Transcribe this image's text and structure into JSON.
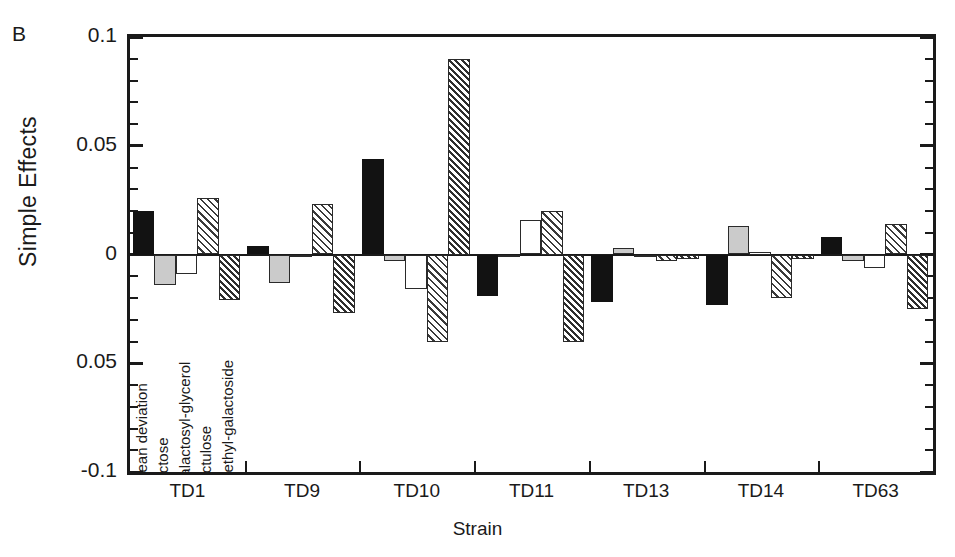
{
  "panel_letter": "B",
  "axis": {
    "ylabel": "Simple Effects",
    "xlabel": "Strain",
    "yticks": [
      "0.1",
      "0.05",
      "0",
      "0.05",
      "-0.1"
    ],
    "ylim": [
      -0.1,
      0.1
    ]
  },
  "legend_labels": [
    "mean deviation",
    "lactose",
    "galactosyl-glycerol",
    "lactulose",
    "methyl-galactoside"
  ],
  "chart_data": {
    "type": "bar",
    "title": "",
    "xlabel": "Strain",
    "ylabel": "Simple Effects",
    "ylim": [
      -0.1,
      0.1
    ],
    "grid": false,
    "legend_position": "in-plot-vertical-left",
    "categories": [
      "TD1",
      "TD9",
      "TD10",
      "TD11",
      "TD13",
      "TD14",
      "TD63"
    ],
    "series": [
      {
        "name": "mean deviation",
        "style": "solid-black",
        "values": [
          0.02,
          0.004,
          0.044,
          -0.019,
          -0.022,
          -0.023,
          0.008
        ]
      },
      {
        "name": "lactose",
        "style": "light-gray",
        "values": [
          -0.014,
          -0.013,
          -0.003,
          -0.001,
          0.003,
          0.013,
          -0.003
        ]
      },
      {
        "name": "galactosyl-glycerol",
        "style": "white",
        "values": [
          -0.009,
          -0.001,
          -0.016,
          0.016,
          -0.001,
          0.001,
          -0.006
        ]
      },
      {
        "name": "lactulose",
        "style": "hatch-light",
        "values": [
          0.026,
          0.023,
          -0.04,
          0.02,
          -0.003,
          -0.02,
          0.014
        ]
      },
      {
        "name": "methyl-galactoside",
        "style": "hatch-dense",
        "values": [
          -0.021,
          -0.027,
          0.09,
          -0.04,
          -0.002,
          -0.002,
          -0.025
        ]
      }
    ]
  }
}
